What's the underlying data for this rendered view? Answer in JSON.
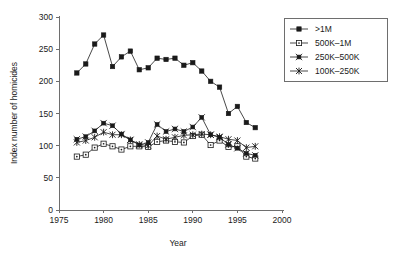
{
  "chart_data": {
    "type": "line",
    "title": "",
    "xlabel": "Year",
    "ylabel": "Index number of homicides",
    "xlim": [
      1975,
      2000
    ],
    "ylim": [
      0,
      300
    ],
    "xticks": [
      1975,
      1980,
      1985,
      1990,
      1995,
      2000
    ],
    "yticks": [
      0,
      50,
      100,
      150,
      200,
      250,
      300
    ],
    "grid": false,
    "legend_position": "top-right",
    "x": [
      1977,
      1978,
      1979,
      1980,
      1981,
      1982,
      1983,
      1984,
      1985,
      1986,
      1987,
      1988,
      1989,
      1990,
      1991,
      1992,
      1993,
      1994,
      1995,
      1996,
      1997
    ],
    "series": [
      {
        "name": ">1M",
        "marker": "filled-square",
        "values": [
          213,
          227,
          258,
          272,
          223,
          238,
          247,
          218,
          221,
          236,
          234,
          236,
          225,
          229,
          216,
          200,
          191,
          150,
          161,
          136,
          128
        ]
      },
      {
        "name": "500K–1M",
        "marker": "open-square",
        "values": [
          83,
          86,
          97,
          103,
          99,
          94,
          99,
          99,
          98,
          106,
          108,
          106,
          105,
          115,
          117,
          101,
          108,
          98,
          99,
          83,
          80
        ]
      },
      {
        "name": "250K–500K",
        "marker": "filled-square-whisker",
        "values": [
          110,
          114,
          123,
          135,
          131,
          118,
          109,
          101,
          105,
          133,
          122,
          126,
          122,
          129,
          144,
          117,
          113,
          102,
          96,
          88,
          85
        ]
      },
      {
        "name": "100K–250K",
        "marker": "x-cross",
        "values": [
          105,
          108,
          113,
          121,
          117,
          117,
          109,
          102,
          100,
          115,
          110,
          113,
          116,
          117,
          118,
          117,
          114,
          110,
          108,
          97,
          99
        ]
      }
    ]
  },
  "legend": {
    "entries": [
      {
        "label": ">1M"
      },
      {
        "label": "500K–1M"
      },
      {
        "label": "250K–500K"
      },
      {
        "label": "100K–250K"
      }
    ]
  },
  "axes": {
    "y_title": "Index number of homicides",
    "x_title": "Year",
    "y_tick_labels": [
      "0",
      "50",
      "100",
      "150",
      "200",
      "250",
      "300"
    ],
    "x_tick_labels": [
      "1975",
      "1980",
      "1985",
      "1990",
      "1995",
      "2000"
    ]
  },
  "style": {
    "ink": "#1a1a1a",
    "axis": "#6e6e6e",
    "background": "#ffffff"
  }
}
